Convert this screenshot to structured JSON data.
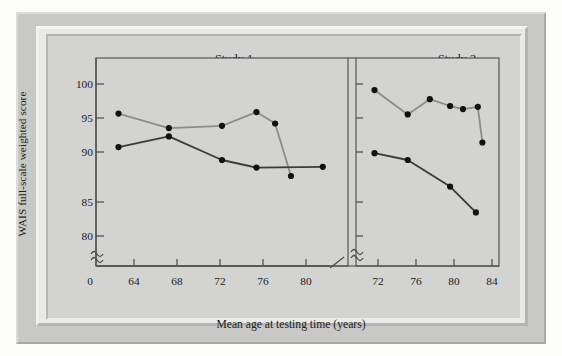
{
  "figure": {
    "y_axis_label": "WAIS full-scale weighted score",
    "x_axis_label": "Mean age at testing time (years)",
    "panel1_title": "Study 1",
    "panel2_title": "Study 2",
    "y_ticks": [
      "100",
      "95",
      "90",
      "85",
      "80"
    ],
    "y_origin_tick": "0",
    "panel1_x_ticks": [
      "64",
      "68",
      "72",
      "76",
      "80"
    ],
    "panel2_x_ticks": [
      "72",
      "76",
      "80",
      "84"
    ],
    "axis_break_symbol": "≈",
    "colors": {
      "frame_outer": "#c8c8c6",
      "frame_inner": "#e9e9e6",
      "plot_background": "#d3d3d1",
      "axis": "#4a4a4a",
      "series_light": "#8c8c8c",
      "series_dark": "#3a3a3a",
      "marker": "#111111",
      "text": "#1d1d1d"
    }
  },
  "chart_data": {
    "type": "line",
    "xlabel": "Mean age at testing time (years)",
    "ylabel": "WAIS full-scale weighted score",
    "ylim": [
      78,
      101.5
    ],
    "y_ticks": [
      80,
      85,
      90,
      95,
      100
    ],
    "y_axis_break": true,
    "grid": false,
    "legend": "none",
    "panels": [
      {
        "name": "Study 1",
        "xlim": [
          62.5,
          81.5
        ],
        "x_ticks": [
          64,
          68,
          72,
          76,
          80
        ],
        "series": [
          {
            "name": "Study 1 upper (light)",
            "color": "#8c8c8c",
            "x": [
              64.2,
              68.0,
              72.0,
              74.6,
              76.0,
              77.2
            ],
            "y": [
              96.1,
              94.2,
              94.5,
              96.3,
              94.8,
              87.9
            ]
          },
          {
            "name": "Study 1 lower (dark)",
            "color": "#3a3a3a",
            "x": [
              64.2,
              68.0,
              72.0,
              74.6,
              79.6
            ],
            "y": [
              91.7,
              93.1,
              90.0,
              89.0,
              89.1
            ]
          }
        ]
      },
      {
        "name": "Study 2",
        "xlim": [
          70.0,
          85.5
        ],
        "x_ticks": [
          72,
          76,
          80,
          84
        ],
        "series": [
          {
            "name": "Study 2 upper (light)",
            "color": "#8c8c8c",
            "x": [
              72.0,
              75.6,
              78.0,
              80.2,
              81.6,
              83.2,
              83.7
            ],
            "y": [
              99.2,
              96.0,
              98.0,
              97.1,
              96.7,
              97.0,
              92.3
            ]
          },
          {
            "name": "Study 2 lower (dark)",
            "color": "#3a3a3a",
            "x": [
              72.0,
              75.6,
              80.2,
              83.0
            ],
            "y": [
              90.9,
              90.0,
              86.5,
              83.1
            ]
          }
        ]
      }
    ]
  }
}
